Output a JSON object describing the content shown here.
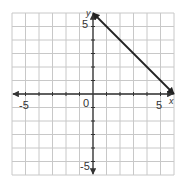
{
  "chart_data": {
    "type": "line",
    "title": "",
    "xlabel": "x",
    "ylabel": "y",
    "xlim": [
      -6,
      6
    ],
    "ylim": [
      -6,
      6
    ],
    "grid": true,
    "tick_labels": {
      "x": [
        {
          "value": -5,
          "label": "-5"
        },
        {
          "value": 5,
          "label": "5"
        }
      ],
      "y": [
        {
          "value": 5,
          "label": "5"
        },
        {
          "value": -5,
          "label": "-5"
        }
      ],
      "origin": "0"
    },
    "series": [
      {
        "name": "line segment with arrows",
        "points": [
          [
            0,
            6
          ],
          [
            6,
            0
          ]
        ],
        "arrows": "both",
        "color": "#222222"
      }
    ]
  },
  "labels": {
    "x_axis": "x",
    "y_axis": "y",
    "origin": "0",
    "x_neg5": "-5",
    "x_pos5": "5",
    "y_pos5": "5",
    "y_neg5": "-5"
  },
  "colors": {
    "grid": "#c8c8c8",
    "axis": "#333333",
    "line": "#222222"
  }
}
